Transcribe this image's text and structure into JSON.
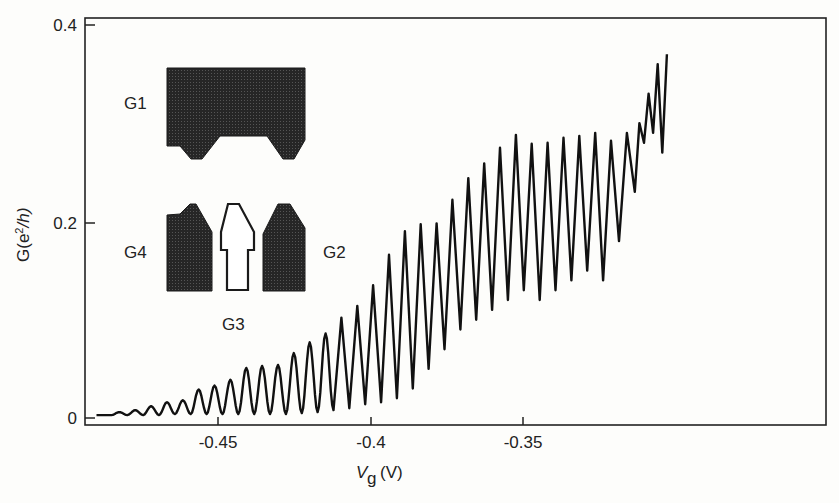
{
  "chart_data": {
    "type": "line",
    "title": "",
    "xlabel": "V_g (V)",
    "ylabel": "G(e²/h)",
    "xlim": [
      -0.49,
      -0.309
    ],
    "ylim": [
      0,
      0.41
    ],
    "grid": false,
    "legend": null,
    "x_ticks": [
      -0.45,
      -0.4,
      -0.35
    ],
    "x_tick_labels": [
      "-0.45",
      "-0.4",
      "-0.35"
    ],
    "y_ticks": [
      0,
      0.2,
      0.4
    ],
    "y_tick_labels": [
      "0",
      "0.2",
      "0.4"
    ],
    "series": [
      {
        "name": "conductance",
        "description": "Coulomb-blockade-like periodic oscillations, period ~0.0052 V, growing amplitude with Vg",
        "peaks": [
          [
            -0.4825,
            0.006
          ],
          [
            -0.4773,
            0.008
          ],
          [
            -0.4721,
            0.012
          ],
          [
            -0.4669,
            0.016
          ],
          [
            -0.4617,
            0.018
          ],
          [
            -0.4565,
            0.029
          ],
          [
            -0.4513,
            0.033
          ],
          [
            -0.4461,
            0.039
          ],
          [
            -0.4409,
            0.051
          ],
          [
            -0.4357,
            0.053
          ],
          [
            -0.4305,
            0.054
          ],
          [
            -0.4253,
            0.066
          ],
          [
            -0.4201,
            0.077
          ],
          [
            -0.4149,
            0.086
          ],
          [
            -0.4097,
            0.102
          ],
          [
            -0.4045,
            0.114
          ],
          [
            -0.3993,
            0.135
          ],
          [
            -0.3941,
            0.166
          ],
          [
            -0.3889,
            0.19
          ],
          [
            -0.3837,
            0.197
          ],
          [
            -0.3785,
            0.198
          ],
          [
            -0.3733,
            0.222
          ],
          [
            -0.3681,
            0.244
          ],
          [
            -0.3629,
            0.259
          ],
          [
            -0.3577,
            0.275
          ],
          [
            -0.3525,
            0.288
          ],
          [
            -0.3473,
            0.279
          ],
          [
            -0.3421,
            0.28
          ],
          [
            -0.3369,
            0.285
          ],
          [
            -0.3317,
            0.287
          ],
          [
            -0.3265,
            0.29
          ],
          [
            -0.3213,
            0.282
          ],
          [
            -0.3161,
            0.29
          ],
          [
            -0.312,
            0.3
          ],
          [
            -0.309,
            0.33
          ],
          [
            -0.306,
            0.36
          ],
          [
            -0.303,
            0.37
          ]
        ],
        "valleys": [
          [
            -0.4851,
            0.003
          ],
          [
            -0.4799,
            0.003
          ],
          [
            -0.4747,
            0.003
          ],
          [
            -0.4695,
            0.003
          ],
          [
            -0.4643,
            0.004
          ],
          [
            -0.4591,
            0.004
          ],
          [
            -0.4539,
            0.004
          ],
          [
            -0.4487,
            0.004
          ],
          [
            -0.4435,
            0.004
          ],
          [
            -0.4383,
            0.004
          ],
          [
            -0.4331,
            0.004
          ],
          [
            -0.4279,
            0.004
          ],
          [
            -0.4227,
            0.005
          ],
          [
            -0.4175,
            0.006
          ],
          [
            -0.4123,
            0.008
          ],
          [
            -0.4071,
            0.01
          ],
          [
            -0.4019,
            0.014
          ],
          [
            -0.3967,
            0.016
          ],
          [
            -0.3915,
            0.02
          ],
          [
            -0.3863,
            0.03
          ],
          [
            -0.3811,
            0.05
          ],
          [
            -0.3759,
            0.07
          ],
          [
            -0.3707,
            0.09
          ],
          [
            -0.3655,
            0.1
          ],
          [
            -0.3603,
            0.11
          ],
          [
            -0.3551,
            0.12
          ],
          [
            -0.3499,
            0.13
          ],
          [
            -0.3447,
            0.12
          ],
          [
            -0.3395,
            0.13
          ],
          [
            -0.3343,
            0.14
          ],
          [
            -0.3291,
            0.15
          ],
          [
            -0.3239,
            0.14
          ],
          [
            -0.3187,
            0.18
          ],
          [
            -0.3135,
            0.23
          ],
          [
            -0.3105,
            0.28
          ],
          [
            -0.3075,
            0.29
          ],
          [
            -0.3045,
            0.27
          ]
        ]
      }
    ],
    "inset": {
      "type": "gate-electrode schematic",
      "labels": [
        "G1",
        "G2",
        "G3",
        "G4"
      ]
    }
  },
  "axes": {
    "xlabel_main": "V",
    "xlabel_sub": "g",
    "xlabel_unit": "(V)",
    "ylabel_prefix": "G(e",
    "ylabel_sup": "2",
    "ylabel_suffix": "/h)"
  },
  "ticks": {
    "x": [
      "-0.45",
      "-0.4",
      "-0.35"
    ],
    "y": [
      "0",
      "0.2",
      "0.4"
    ]
  },
  "inset_labels": {
    "g1": "G1",
    "g2": "G2",
    "g3": "G3",
    "g4": "G4"
  },
  "colors": {
    "line": "#111111",
    "gate_fill": "#2b2b2b",
    "background": "#fdfdfb"
  }
}
